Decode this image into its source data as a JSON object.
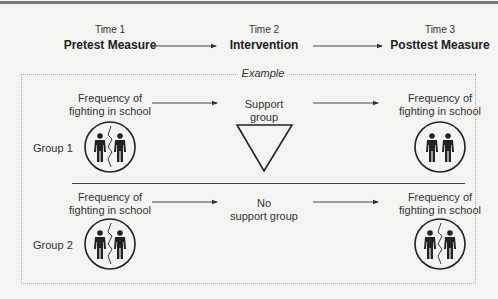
{
  "header": {
    "stages": [
      {
        "time": "Time 1",
        "name": "Pretest Measure"
      },
      {
        "time": "Time 2",
        "name": "Intervention"
      },
      {
        "time": "Time 3",
        "name": "Posttest Measure"
      }
    ]
  },
  "example": {
    "label": "Example",
    "groups": [
      {
        "label": "Group 1",
        "pretest": {
          "line1": "Frequency of",
          "line2": "fighting in school",
          "icon": "fighting-people-icon"
        },
        "intervention": {
          "line1": "Support",
          "line2": "group",
          "icon": "triangle-icon"
        },
        "posttest": {
          "line1": "Frequency of",
          "line2": "fighting in school",
          "icon": "peaceful-people-icon"
        }
      },
      {
        "label": "Group 2",
        "pretest": {
          "line1": "Frequency of",
          "line2": "fighting in school",
          "icon": "fighting-people-icon"
        },
        "intervention": {
          "line1": "No",
          "line2": "support group"
        },
        "posttest": {
          "line1": "Frequency of",
          "line2": "fighting in school",
          "icon": "fighting-people-icon"
        }
      }
    ]
  },
  "colors": {
    "background": "#f4f4f2",
    "ink": "#222222",
    "border": "#aaaaaa"
  }
}
